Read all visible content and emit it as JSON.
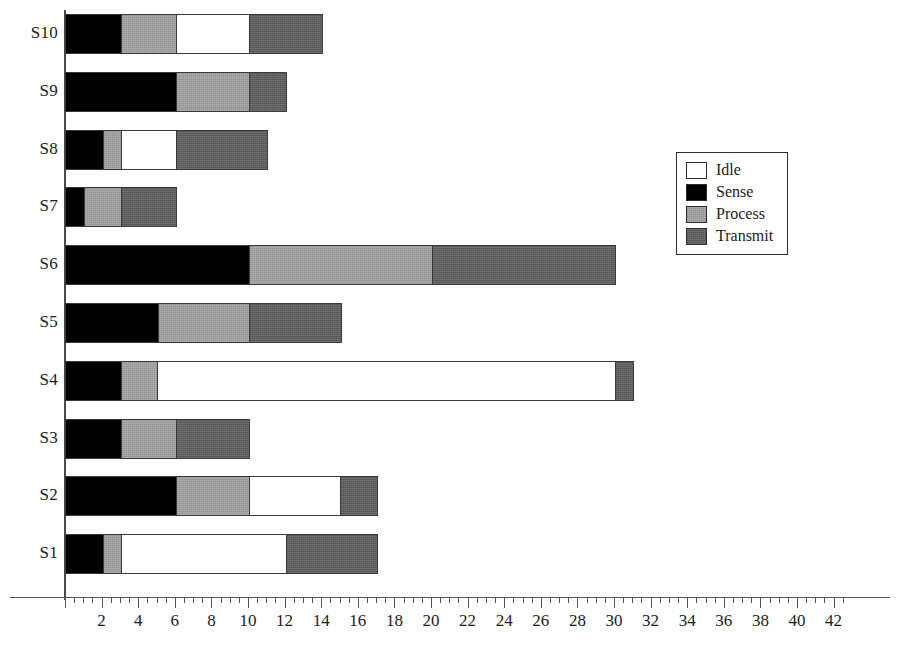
{
  "chart_data": {
    "type": "bar",
    "orientation": "horizontal",
    "stacked": true,
    "title": "",
    "xlabel": "",
    "ylabel": "",
    "xlim": [
      0,
      43
    ],
    "ylim": null,
    "grid": false,
    "legend_position": "right",
    "x_major_step": 2,
    "x_minor_step": 0.5,
    "xticks": [
      2,
      4,
      6,
      8,
      10,
      12,
      14,
      16,
      18,
      20,
      22,
      24,
      26,
      28,
      30,
      32,
      34,
      36,
      38,
      40,
      42
    ],
    "xtick_labels": [
      "2",
      "4",
      "6",
      "8",
      "10",
      "12",
      "14",
      "16",
      "18",
      "20",
      "22",
      "24",
      "26",
      "28",
      "30",
      "32",
      "34",
      "36",
      "38",
      "40",
      "42"
    ],
    "categories": [
      "S1",
      "S2",
      "S3",
      "S4",
      "S5",
      "S6",
      "S7",
      "S8",
      "S9",
      "S10"
    ],
    "series": [
      {
        "name": "Idle",
        "color": "#ffffff",
        "values": [
          9,
          5,
          0,
          25,
          0,
          0,
          0,
          3,
          0,
          4
        ]
      },
      {
        "name": "Sense",
        "color": "#000000",
        "values": [
          2,
          6,
          3,
          3,
          5,
          10,
          1,
          2,
          6,
          3
        ]
      },
      {
        "name": "Process",
        "color": "#9e9e9e",
        "values": [
          1,
          4,
          3,
          2,
          5,
          10,
          2,
          1,
          4,
          3
        ]
      },
      {
        "name": "Transmit",
        "color": "#5c5c5c",
        "values": [
          5,
          2,
          4,
          1,
          5,
          10,
          3,
          5,
          2,
          4
        ]
      }
    ],
    "stack_order": [
      "Sense",
      "Process",
      "Idle",
      "Transmit"
    ],
    "bars": [
      {
        "category": "S10",
        "total": 14,
        "segments": [
          {
            "name": "Sense",
            "value": 3
          },
          {
            "name": "Process",
            "value": 3
          },
          {
            "name": "Idle",
            "value": 4
          },
          {
            "name": "Transmit",
            "value": 4
          }
        ]
      },
      {
        "category": "S9",
        "total": 12,
        "segments": [
          {
            "name": "Sense",
            "value": 6
          },
          {
            "name": "Process",
            "value": 4
          },
          {
            "name": "Transmit",
            "value": 2
          }
        ]
      },
      {
        "category": "S8",
        "total": 11,
        "segments": [
          {
            "name": "Sense",
            "value": 2
          },
          {
            "name": "Process",
            "value": 1
          },
          {
            "name": "Idle",
            "value": 3
          },
          {
            "name": "Transmit",
            "value": 5
          }
        ]
      },
      {
        "category": "S7",
        "total": 6,
        "segments": [
          {
            "name": "Sense",
            "value": 1
          },
          {
            "name": "Process",
            "value": 2
          },
          {
            "name": "Transmit",
            "value": 3
          }
        ]
      },
      {
        "category": "S6",
        "total": 30,
        "segments": [
          {
            "name": "Sense",
            "value": 10
          },
          {
            "name": "Process",
            "value": 10
          },
          {
            "name": "Transmit",
            "value": 10
          }
        ]
      },
      {
        "category": "S5",
        "total": 15,
        "segments": [
          {
            "name": "Sense",
            "value": 5
          },
          {
            "name": "Process",
            "value": 5
          },
          {
            "name": "Transmit",
            "value": 5
          }
        ]
      },
      {
        "category": "S4",
        "total": 31,
        "segments": [
          {
            "name": "Sense",
            "value": 3
          },
          {
            "name": "Process",
            "value": 2
          },
          {
            "name": "Idle",
            "value": 25
          },
          {
            "name": "Transmit",
            "value": 1
          }
        ]
      },
      {
        "category": "S3",
        "total": 10,
        "segments": [
          {
            "name": "Sense",
            "value": 3
          },
          {
            "name": "Process",
            "value": 3
          },
          {
            "name": "Transmit",
            "value": 4
          }
        ]
      },
      {
        "category": "S2",
        "total": 17,
        "segments": [
          {
            "name": "Sense",
            "value": 6
          },
          {
            "name": "Process",
            "value": 4
          },
          {
            "name": "Idle",
            "value": 5
          },
          {
            "name": "Transmit",
            "value": 2
          }
        ]
      },
      {
        "category": "S1",
        "total": 17,
        "segments": [
          {
            "name": "Sense",
            "value": 2
          },
          {
            "name": "Process",
            "value": 1
          },
          {
            "name": "Idle",
            "value": 9
          },
          {
            "name": "Transmit",
            "value": 5
          }
        ]
      }
    ]
  },
  "legend": {
    "items": [
      {
        "label": "Idle",
        "color": "#ffffff"
      },
      {
        "label": "Sense",
        "color": "#000000"
      },
      {
        "label": "Process",
        "color": "#9e9e9e"
      },
      {
        "label": "Transmit",
        "color": "#5c5c5c"
      }
    ]
  },
  "axis": {
    "origin_px": 65,
    "px_per_unit": 18.3,
    "baseline_px": 597
  }
}
